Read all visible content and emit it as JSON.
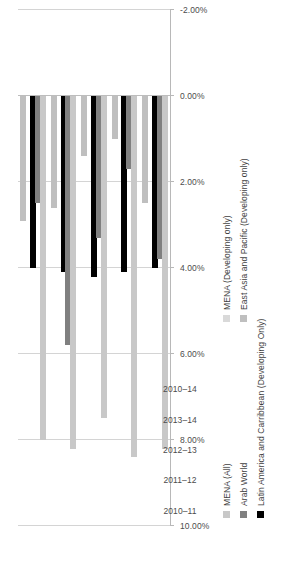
{
  "chart_data": {
    "type": "bar",
    "orientation": "vertical",
    "title": "",
    "xlabel": "",
    "ylabel": "",
    "categories": [
      "2010–11",
      "2011–12",
      "2012–13",
      "2013–14",
      "2010–14"
    ],
    "ylim": [
      -2.0,
      10.0
    ],
    "ytick_labels": [
      "-2.00%",
      "0.00%",
      "2.00%",
      "4.00%",
      "6.00%",
      "8.00%",
      "10.00%"
    ],
    "ytick_values": [
      -2.0,
      0.0,
      2.0,
      4.0,
      6.0,
      8.0,
      10.0
    ],
    "grid": true,
    "legend_position": "bottom",
    "series": [
      {
        "name": "MENA (All)",
        "color": "#c8c8c8",
        "values": [
          8.0,
          8.2,
          7.5,
          8.4,
          8.2
        ]
      },
      {
        "name": "Arab World",
        "color": "#808080",
        "values": [
          2.5,
          5.8,
          3.3,
          1.7,
          3.8
        ]
      },
      {
        "name": "Latin America and Carribbean (Developing Only)",
        "color": "#000000",
        "values": [
          4.0,
          4.1,
          4.2,
          4.1,
          4.0
        ]
      },
      {
        "name": "MENA (Developing only)",
        "color": "#d9d9d9",
        "values": [
          0.0,
          0.0,
          0.0,
          0.0,
          0.0
        ]
      },
      {
        "name": "East Asia and Pacific (Developing only)",
        "color": "#bfbfbf",
        "values": [
          2.9,
          2.6,
          1.4,
          1.0,
          2.5
        ]
      }
    ]
  },
  "legend": {
    "column_one": [
      {
        "label": "MENA (All)",
        "color": "#c8c8c8"
      },
      {
        "label": "Arab World",
        "color": "#808080"
      },
      {
        "label": "Latin America and Carribbean (Developing Only)",
        "color": "#000000"
      }
    ],
    "column_two": [
      {
        "label": "MENA (Developing only)",
        "color": "#d9d9d9"
      },
      {
        "label": "East Asia and Pacific (Developing only)",
        "color": "#bfbfbf"
      }
    ]
  },
  "axes": {
    "value_axis_labels": [
      "10.00%",
      "8.00%",
      "6.00%",
      "4.00%",
      "2.00%",
      "0.00%",
      "-2.00%"
    ],
    "category_axis_labels": [
      "2010–11",
      "2011–12",
      "2012–13",
      "2013–14",
      "2010–14"
    ]
  }
}
